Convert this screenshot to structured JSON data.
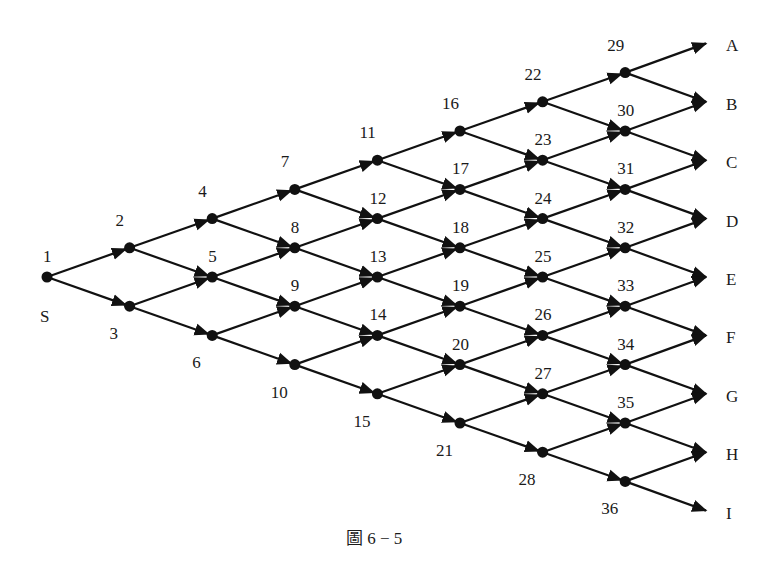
{
  "diagram": {
    "type": "lattice-network",
    "caption": "圖 6 − 5",
    "source_label": "S",
    "layout": {
      "origin_x": 47,
      "origin_y": 277,
      "col_step": 82.6,
      "half_row_step": 29.2,
      "terminal_x": 706,
      "terminal_label_x": 726
    },
    "colors": {
      "stroke": "#111111",
      "text": "#1a1a1a",
      "background": "#ffffff"
    },
    "columns": [
      [
        1
      ],
      [
        2,
        3
      ],
      [
        4,
        5,
        6
      ],
      [
        7,
        8,
        9,
        10
      ],
      [
        11,
        12,
        13,
        14,
        15
      ],
      [
        16,
        17,
        18,
        19,
        20,
        21
      ],
      [
        22,
        23,
        24,
        25,
        26,
        27,
        28
      ],
      [
        29,
        30,
        31,
        32,
        33,
        34,
        35,
        36
      ]
    ],
    "terminals": [
      "A",
      "B",
      "C",
      "D",
      "E",
      "F",
      "G",
      "H",
      "I"
    ],
    "edge_rule": "each node branches up-right and down-right to the next column; last column branches to terminals A–I"
  }
}
